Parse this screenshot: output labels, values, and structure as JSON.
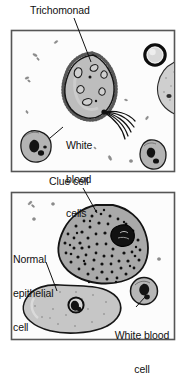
{
  "figure": {
    "background_color": "#ffffff",
    "width": 184,
    "height": 351
  },
  "panels": [
    {
      "id": "panel-top",
      "name": "trichomonad-panel",
      "border_color": "#555555",
      "background_color": "#fbfbfb",
      "rect": {
        "x": 11,
        "y": 30,
        "w": 164,
        "h": 142
      },
      "labels": [
        {
          "id": "trichomonad",
          "text": "Trichomonad",
          "lines": [
            "Trichomonad"
          ],
          "leader": {
            "from_x": 74,
            "from_y": 18,
            "to_x": 91,
            "to_y": 62
          }
        },
        {
          "id": "white-blood-cells",
          "text": "White blood cells",
          "lines": [
            "White",
            "blood",
            "cells"
          ],
          "leader": {
            "from_x": 64,
            "from_y": 128,
            "to_x": 50,
            "to_y": 137
          }
        }
      ]
    },
    {
      "id": "panel-bottom",
      "name": "clue-cell-panel",
      "border_color": "#555555",
      "background_color": "#fbfbfb",
      "rect": {
        "x": 11,
        "y": 192,
        "w": 164,
        "h": 148
      },
      "labels": [
        {
          "id": "clue-cell",
          "text": "Clue cell",
          "lines": [
            "Clue cell"
          ],
          "leader": {
            "from_x": 83,
            "from_y": 189,
            "to_x": 97,
            "to_y": 213
          }
        },
        {
          "id": "normal-epithelial-cell",
          "text": "Normal epithelial cell",
          "lines": [
            "Normal",
            "epithelial",
            "cell"
          ],
          "leader": {
            "from_x": 45,
            "from_y": 263,
            "to_x": 57,
            "to_y": 290
          }
        },
        {
          "id": "white-blood-cell",
          "text": "White blood cell",
          "lines": [
            "White blood",
            "cell"
          ],
          "leader": {
            "from_x": 135,
            "from_y": 308,
            "to_x": 144,
            "to_y": 297
          }
        }
      ]
    }
  ],
  "cells": {
    "trichomonad": {
      "name": "trichomonad-cell",
      "fill": "#b9b9b9",
      "outline": "#1b1b1b",
      "flagella_count": 5,
      "vacuole_count": 6,
      "description": "Pear-shaped flagellated protozoan with fringed margin"
    },
    "clue_cell": {
      "name": "clue-cell",
      "fill": "#a8a8a8",
      "outline": "#1b1b1b",
      "stipple_count": 120,
      "description": "Epithelial cell covered with coccobacilli and a dark nucleus"
    },
    "normal_epithelial_cell": {
      "name": "normal-epithelial-cell",
      "fill": "#c4c4c4",
      "outline": "#1b1b1b",
      "description": "Large flat squamous cell with a single round nucleus"
    },
    "white_blood_cells": {
      "name": "white-blood-cell",
      "fill": "#b0b0b0",
      "outline": "#1b1b1b",
      "count_top_panel": 2,
      "count_bottom_panel": 1,
      "description": "Small round cell with lobed dark nucleus"
    },
    "ring_cell": {
      "name": "ring-cell",
      "fill": "#e4e4e4",
      "outline": "#111111",
      "description": "Dark thick-rimmed round cell at upper right"
    },
    "debris": {
      "name": "debris-particle",
      "fill": "#9a9a9a",
      "description": "Small scattered bacterial rods and debris"
    }
  },
  "colors": {
    "ink": "#111111",
    "panel_border": "#555555",
    "cell_outline": "#1b1b1b",
    "page_background": "#ffffff"
  }
}
